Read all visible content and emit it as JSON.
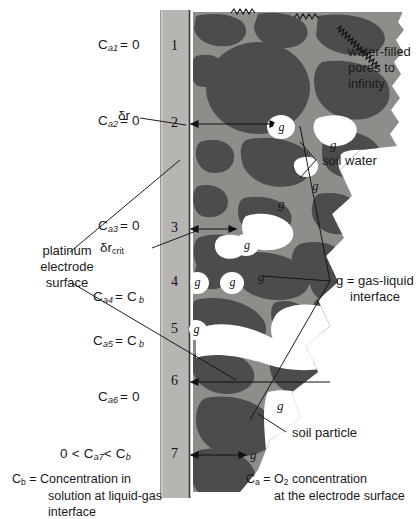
{
  "figure": {
    "title_visible": false,
    "colors": {
      "electrode_fill": "#b7b5b1",
      "electrode_edge": "#5e5c59",
      "soil_matrix": "#8d8d8a",
      "soil_particle": "#4c4c4a",
      "water": "#ffffff",
      "ink": "#1a1a1a"
    }
  },
  "left_labels": {
    "c1": "C",
    "c1_sub": "a1",
    "c1_rest": "= 0",
    "c2": "C",
    "c2_sub": "a2",
    "c2_rest": "= 0",
    "c3": "C",
    "c3_sub": "a3",
    "c3_rest": "= 0",
    "c4": "C",
    "c4_sub": "a4",
    "c4_rest": "= C",
    "c4_sub2": "b",
    "c5": "C",
    "c5_sub": "a5",
    "c5_rest": "= C",
    "c5_sub2": "b",
    "c6": "C",
    "c6_sub": "a6",
    "c6_rest": "= 0",
    "c7_pre": "0 <",
    "c7": "C",
    "c7_sub": "a7",
    "c7_rest": "< C",
    "c7_sub2": "b"
  },
  "annotations": {
    "delta_r": "δr",
    "delta_r_crit_symbol": "δr",
    "delta_r_crit_sub": "crit",
    "platinum": "platinum\nelectrode\nsurface",
    "platinum_l1": "platinum",
    "platinum_l2": "electrode",
    "platinum_l3": "surface",
    "water_filled_l1": "water-filled",
    "water_filled_l2": "pores to",
    "water_filled_l3": "infinity",
    "soil_water": "soil water",
    "soil_particle": "soil particle",
    "gas_liquid_l1": "g = gas-liquid",
    "gas_liquid_l2": "interface",
    "g_symbol": "g"
  },
  "markers": [
    {
      "id": "1",
      "label": "1"
    },
    {
      "id": "2",
      "label": "2"
    },
    {
      "id": "3",
      "label": "3"
    },
    {
      "id": "4",
      "label": "4"
    },
    {
      "id": "5",
      "label": "5"
    },
    {
      "id": "6",
      "label": "6"
    },
    {
      "id": "7",
      "label": "7"
    }
  ],
  "caption": {
    "cb_symbol": "C",
    "cb_sub": "b",
    "cb_l1": "= Concentration in",
    "cb_l2": "solution at liquid-gas",
    "cb_l3": "interface",
    "ca_symbol": "C",
    "ca_sub": "a",
    "ca_l1": "= O",
    "ca_l1_sub": "2",
    "ca_l1_rest": " concentration",
    "ca_l2": "at the electrode surface"
  }
}
